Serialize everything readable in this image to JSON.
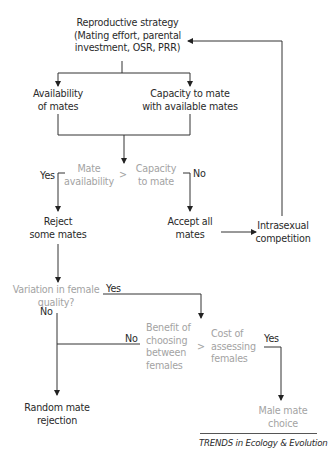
{
  "diagram": {
    "colors": {
      "primary_text": "#2a2a2a",
      "secondary_text": "#a3a3a3",
      "lines": "#333333"
    },
    "nodes": {
      "reproductive_strategy": "Reproductive strategy\n(Mating effort, parental\ninvestment, OSR, PRR)",
      "availability_of_mates": "Availability\nof mates",
      "capacity_to_mate_available": "Capacity to mate\nwith available mates",
      "mate_availability": "Mate\navailability",
      "comparator_1": ">",
      "capacity_to_mate": "Capacity\nto mate",
      "reject_some_mates": "Reject\nsome mates",
      "accept_all_mates": "Accept all\nmates",
      "intrasexual_competition": "Intrasexual\ncompetition",
      "variation_in_female_quality": "Variation in female\nquality?",
      "benefit_of_choosing": "Benefit of\nchoosing\nbetween\nfemales",
      "comparator_2": ">",
      "cost_of_assessing": "Cost of\nassessing\nfemales",
      "random_mate_rejection": "Random mate\nrejection",
      "male_mate_choice": "Male mate\nchoice"
    },
    "edge_labels": {
      "yes_reject": "Yes",
      "no_accept": "No",
      "yes_variation": "Yes",
      "no_variation": "No",
      "no_benefit": "No",
      "yes_cost": "Yes"
    },
    "source": "TRENDS in Ecology & Evolution"
  }
}
